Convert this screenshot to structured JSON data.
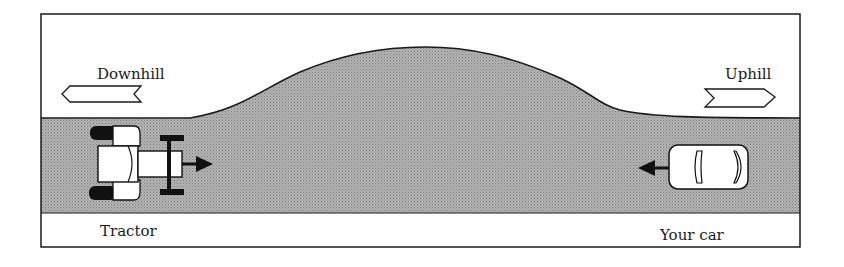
{
  "diagram": {
    "labels": {
      "downhill": "Downhill",
      "uphill": "Uphill",
      "tractor": "Tractor",
      "your_car": "Your car"
    },
    "elements": {
      "frame": "border-rectangle",
      "hill": "hill-crest",
      "road": "road-band",
      "tractor": "tractor-icon",
      "car": "car-icon",
      "downhill_arrow": "arrow-left-icon",
      "uphill_arrow": "arrow-right-icon",
      "tractor_direction": "arrow-right-icon",
      "car_direction": "arrow-left-icon"
    },
    "colors": {
      "road_fill": "#a8a8a8",
      "stroke": "#1a1a1a",
      "background": "#ffffff"
    }
  }
}
